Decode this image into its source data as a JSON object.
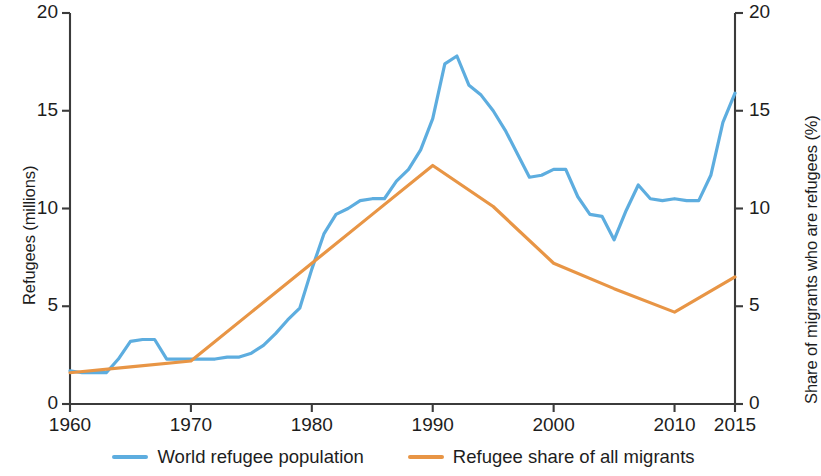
{
  "chart_data": {
    "type": "line",
    "title": "",
    "subtitle": "",
    "xlabel": "",
    "ylabel": "Refugees (millions)",
    "y2label": "Share of migrants who are refugees (%)",
    "grid": false,
    "legend_position": "bottom",
    "xlim": [
      1960,
      2015
    ],
    "ylim": [
      0,
      20
    ],
    "y2lim": [
      0,
      20
    ],
    "xticks": [
      1960,
      1970,
      1980,
      1990,
      2000,
      2010,
      2015
    ],
    "xtick_labels": [
      "1960",
      "1970",
      "1980",
      "1990",
      "2000",
      "2010",
      "2015"
    ],
    "yticks": [
      0,
      5,
      10,
      15,
      20
    ],
    "ytick_labels": [
      "0",
      "5",
      "10",
      "15",
      "20"
    ],
    "y2ticks": [
      0,
      5,
      10,
      15,
      20
    ],
    "y2tick_labels": [
      "0",
      "5",
      "10",
      "15",
      "20"
    ],
    "series": [
      {
        "name": "World refugee population",
        "axis": "left",
        "unit": "millions",
        "color": "#5DADDF",
        "x": [
          1960,
          1961,
          1962,
          1963,
          1964,
          1965,
          1966,
          1967,
          1968,
          1969,
          1970,
          1971,
          1972,
          1973,
          1974,
          1975,
          1976,
          1977,
          1978,
          1979,
          1980,
          1981,
          1982,
          1983,
          1984,
          1985,
          1986,
          1987,
          1988,
          1989,
          1990,
          1991,
          1992,
          1993,
          1994,
          1995,
          1996,
          1997,
          1998,
          1999,
          2000,
          2001,
          2002,
          2003,
          2004,
          2005,
          2006,
          2007,
          2008,
          2009,
          2010,
          2011,
          2012,
          2013,
          2014,
          2015
        ],
        "y": [
          1.7,
          1.6,
          1.6,
          1.6,
          2.3,
          3.2,
          3.3,
          3.3,
          2.3,
          2.3,
          2.3,
          2.3,
          2.3,
          2.4,
          2.4,
          2.6,
          3.0,
          3.6,
          4.3,
          4.9,
          6.9,
          8.7,
          9.7,
          10.0,
          10.4,
          10.5,
          10.5,
          11.4,
          12.0,
          13.0,
          14.6,
          17.4,
          17.8,
          16.3,
          15.8,
          15.0,
          14.0,
          12.8,
          11.6,
          11.7,
          12.0,
          12.0,
          10.6,
          9.7,
          9.6,
          8.4,
          9.9,
          11.2,
          10.5,
          10.4,
          10.5,
          10.4,
          10.4,
          11.7,
          14.4,
          15.9
        ]
      },
      {
        "name": "Refugee share of all migrants",
        "axis": "right",
        "unit": "percent",
        "color": "#E89545",
        "x": [
          1960,
          1965,
          1970,
          1975,
          1980,
          1985,
          1990,
          1995,
          2000,
          2005,
          2010,
          2015
        ],
        "y": [
          1.6,
          1.9,
          2.2,
          4.7,
          7.2,
          9.7,
          12.2,
          10.1,
          7.2,
          5.9,
          4.7,
          6.5
        ]
      }
    ]
  },
  "legend": {
    "items": [
      {
        "label": "World refugee population",
        "color": "#5DADDF"
      },
      {
        "label": "Refugee share of all migrants",
        "color": "#E89545"
      }
    ]
  },
  "colors": {
    "blue": "#5DADDF",
    "orange": "#E89545",
    "axis": "#3b3b3b",
    "text": "#1d1d1d",
    "background": "#ffffff"
  }
}
